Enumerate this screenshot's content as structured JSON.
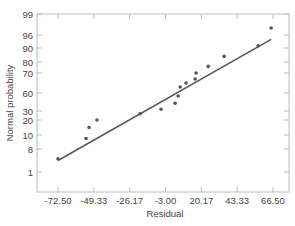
{
  "chart_data": {
    "type": "scatter",
    "title": "",
    "xlabel": "Residual",
    "ylabel": "Normal probability",
    "x_ticks": [
      "-72.50",
      "-49.33",
      "-26.17",
      "-3.00",
      "20.17",
      "43.33",
      "66.50"
    ],
    "x_tick_values": [
      -72.5,
      -49.33,
      -26.17,
      -3.0,
      20.17,
      43.33,
      66.5
    ],
    "y_ticks": [
      "1",
      "8",
      "10",
      "20",
      "30",
      "60",
      "70",
      "80",
      "90",
      "96",
      "99"
    ],
    "y_tick_values": [
      1,
      8,
      10,
      20,
      30,
      60,
      70,
      80,
      90,
      96,
      99
    ],
    "xlim": [
      -86,
      76
    ],
    "ylim": [
      0.2,
      99
    ],
    "grid": false,
    "legend": "none",
    "series": [
      {
        "name": "residuals",
        "kind": "scatter",
        "color": "#555555",
        "x": [
          -72.5,
          -54.4,
          -52.4,
          -47.3,
          -19.4,
          -5.9,
          3.2,
          5.2,
          6.5,
          10.3,
          16.2,
          16.8,
          24.6,
          34.9,
          56.9,
          65.3
        ],
        "y": [
          5,
          9.5,
          15,
          20,
          27,
          33,
          43,
          55,
          63,
          65,
          67,
          70,
          76,
          84,
          91,
          97
        ]
      },
      {
        "name": "fitted line",
        "kind": "line",
        "color": "#555555",
        "x": [
          -72.5,
          65.3
        ],
        "y": [
          4.5,
          94
        ]
      }
    ]
  },
  "axes": {
    "xlabel": "Residual",
    "ylabel": "Normal probability"
  },
  "colors": {
    "frame": "#bbbbbb",
    "ink": "#555555",
    "text": "#444444"
  }
}
